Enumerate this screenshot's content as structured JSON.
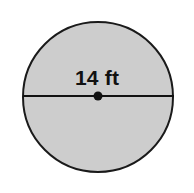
{
  "figure": {
    "type": "circle-with-diameter",
    "background_color": "#ffffff",
    "shape": {
      "name": "circle",
      "fill_color": "#cdcdcd",
      "stroke_color": "#1a1a1a",
      "stroke_width": 2,
      "center_x": 98,
      "center_y": 97,
      "radius": 76
    },
    "diameter_line": {
      "name": "diameter",
      "color": "#111111",
      "width": 2,
      "x1": 22,
      "y1": 96,
      "x2": 175,
      "y2": 96
    },
    "center_point": {
      "name": "center-dot",
      "color": "#111111",
      "cx": 98,
      "cy": 96,
      "r": 4.5
    },
    "label": {
      "text": "14 ft",
      "value": "14",
      "unit": "ft",
      "color": "#111111"
    }
  }
}
